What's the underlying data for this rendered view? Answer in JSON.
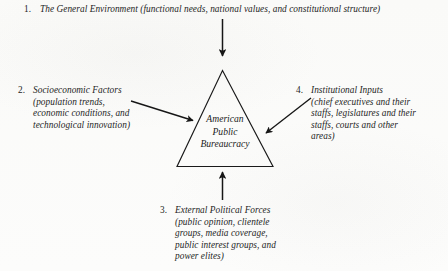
{
  "figure": {
    "background_color": "#fbfbfa",
    "ink_color": "#1b1b1b"
  },
  "center": {
    "shape": "triangle",
    "label_lines": [
      "American",
      "Public",
      "Bureaucracy"
    ],
    "line1": "American",
    "line2": "Public",
    "line3": "Bureaucracy"
  },
  "items": [
    {
      "number": "1.",
      "title": "The General Environment",
      "detail": "(functional needs, national values, and constitutional structure)",
      "full": "The General Environment (functional needs, national values, and constitutional structure)",
      "position": "top"
    },
    {
      "number": "2.",
      "title": "Socioeconomic Factors",
      "detail": "(population trends, economic conditions, and technological innovation)",
      "full": "Socioeconomic Factors\n(population trends,\neconomic conditions, and\ntechnological innovation)",
      "position": "left"
    },
    {
      "number": "3.",
      "title": "External Political Forces",
      "detail": "(public opinion, clientele groups, media coverage, public interest groups, and power elites)",
      "full": "External Political Forces\n(public opinion, clientele\ngroups, media coverage,\npublic interest groups, and\npower elites)",
      "position": "bottom"
    },
    {
      "number": "4.",
      "title": "Institutional Inputs",
      "detail": "(chief executives and their staffs, legislatures and their staffs, courts and other areas)",
      "full": "Institutional Inputs\n(chief executives and their\nstaffs, legislatures and their\nstaffs, courts and other\nareas)",
      "position": "right"
    }
  ],
  "arrows": [
    {
      "name": "arrow-top-down",
      "from": "item 1",
      "to": "triangle apex"
    },
    {
      "name": "arrow-left-right",
      "from": "item 2",
      "to": "triangle left side"
    },
    {
      "name": "arrow-right-left",
      "from": "item 4",
      "to": "triangle right side"
    },
    {
      "name": "arrow-bottom-up",
      "from": "item 3",
      "to": "triangle base"
    }
  ]
}
